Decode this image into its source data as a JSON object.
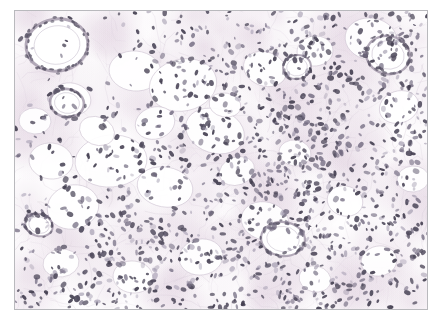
{
  "figure": {
    "kind": "histology-micrograph",
    "stain": "H&E",
    "frame": {
      "x": 14,
      "y": 10,
      "width": 414,
      "height": 300
    },
    "frame_color": "#b9b9bd",
    "page_background": "#ffffff",
    "tissue_background": "#fdfcfd"
  },
  "chart_data": {
    "type": "scatter",
    "title": "",
    "xlabel": "",
    "ylabel": "",
    "xlim": [
      0,
      414
    ],
    "ylim": [
      0,
      300
    ],
    "grid": false,
    "legend": "none",
    "palette": {
      "nucleus_dark": "#4a4458",
      "nucleus_mid": "#6f6780",
      "nucleus_soft": "#918aa0",
      "stroma_pink": "#e8dfe6",
      "vessel_wall": "#b7aebd",
      "adipocyte_fill": "#ffffff",
      "adipocyte_edge": "#ded6e0"
    },
    "series": [
      {
        "name": "adipocyte-vacuoles",
        "type": "ellipse-outlines",
        "values": [
          [
            44,
            36,
            30,
            25,
            -8
          ],
          [
            56,
            88,
            20,
            16,
            12
          ],
          [
            120,
            60,
            26,
            20,
            5
          ],
          [
            168,
            74,
            34,
            26,
            -12
          ],
          [
            200,
            120,
            30,
            22,
            18
          ],
          [
            96,
            150,
            36,
            26,
            -5
          ],
          [
            150,
            176,
            28,
            20,
            10
          ],
          [
            58,
            196,
            26,
            22,
            -14
          ],
          [
            36,
            150,
            22,
            18,
            6
          ],
          [
            250,
            58,
            22,
            17,
            20
          ],
          [
            300,
            40,
            18,
            15,
            -6
          ],
          [
            356,
            28,
            26,
            21,
            9
          ],
          [
            384,
            96,
            20,
            16,
            -18
          ],
          [
            250,
            210,
            24,
            19,
            14
          ],
          [
            186,
            246,
            22,
            18,
            -9
          ],
          [
            118,
            266,
            20,
            16,
            7
          ],
          [
            330,
            190,
            18,
            15,
            16
          ],
          [
            398,
            168,
            16,
            13,
            -4
          ],
          [
            82,
            120,
            18,
            14,
            22
          ],
          [
            222,
            160,
            18,
            14,
            -20
          ],
          [
            280,
            142,
            16,
            13,
            8
          ],
          [
            140,
            112,
            20,
            16,
            -16
          ],
          [
            20,
            110,
            16,
            13,
            4
          ],
          [
            364,
            250,
            18,
            15,
            -11
          ],
          [
            300,
            268,
            16,
            13,
            13
          ],
          [
            46,
            252,
            18,
            14,
            -7
          ],
          [
            210,
            94,
            16,
            12,
            11
          ]
        ]
      },
      {
        "name": "vessel-structures",
        "type": "ring",
        "values": [
          [
            42,
            34,
            31,
            26,
            -8,
            3.0
          ],
          [
            52,
            92,
            17,
            14,
            10,
            2.6
          ],
          [
            373,
            44,
            22,
            19,
            14,
            2.4
          ],
          [
            282,
            56,
            14,
            12,
            -10,
            2.0
          ],
          [
            268,
            228,
            22,
            17,
            6,
            2.2
          ],
          [
            24,
            214,
            14,
            11,
            18,
            2.0
          ]
        ]
      },
      {
        "name": "nuclei",
        "type": "ellipse-filled",
        "count": 1450,
        "size_range_px": [
          1.4,
          3.6
        ],
        "density_note": "sparse upper-left near adipocytes, dense right and lower-left"
      },
      {
        "name": "stromal-fibers",
        "type": "polyline",
        "count": 260,
        "stroke": "#ddd4dd"
      }
    ]
  }
}
